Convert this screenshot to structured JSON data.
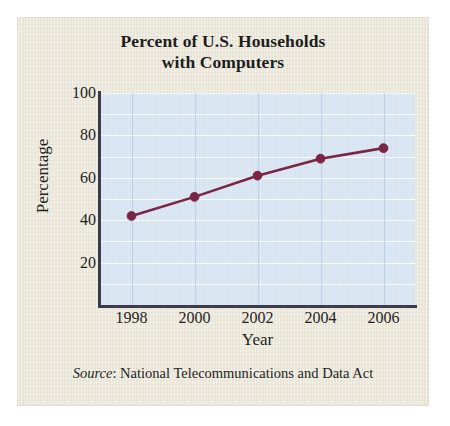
{
  "figure": {
    "title_line_1": "Percent of U.S. Households",
    "title_line_2": "with Computers",
    "source_label": "Source",
    "source_separator": ":",
    "source_text": "National Telecommunications and Data Act",
    "panel_color": "#ebe8db",
    "plot_background_color": "#dbe7f3",
    "axis_color": "#3c3b4c",
    "gridline_color": "#fbfdff",
    "series_color": "#7b2444"
  },
  "chart_data": {
    "type": "line",
    "title": "Percent of U.S. Households with Computers",
    "xlabel": "Year",
    "ylabel": "Percentage",
    "x": [
      1998,
      2000,
      2002,
      2004,
      2006
    ],
    "categories": [
      "1998",
      "2000",
      "2002",
      "2004",
      "2006"
    ],
    "values": [
      42,
      51,
      61,
      69,
      74
    ],
    "series": [
      {
        "name": "Percent of U.S. households with computers",
        "values": [
          42,
          51,
          61,
          69,
          74
        ],
        "color": "#7b2444",
        "marker": "circle"
      }
    ],
    "xlim": [
      1997,
      2007
    ],
    "ylim": [
      0,
      100
    ],
    "ytick_labels": [
      "100",
      "80",
      "60",
      "40",
      "20"
    ],
    "ytick_values": [
      100,
      80,
      60,
      40,
      20
    ],
    "xtick_labels": [
      "1998",
      "2000",
      "2002",
      "2004",
      "2006"
    ],
    "xtick_values": [
      1998,
      2000,
      2002,
      2004,
      2006
    ],
    "grid": "horizontal-and-vertical",
    "grid_step_y": 10,
    "legend": "none"
  }
}
